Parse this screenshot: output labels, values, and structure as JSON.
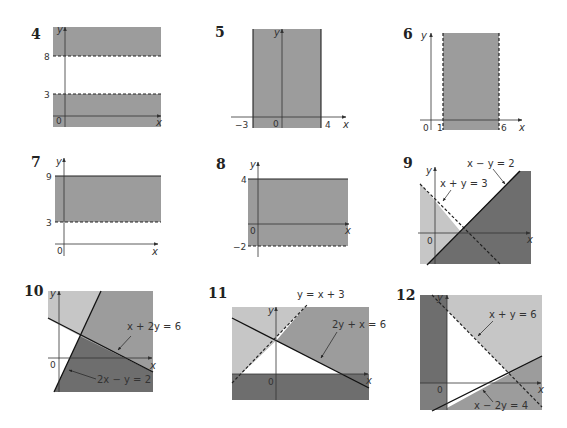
{
  "colors": {
    "background": "#ffffff",
    "shade_medium": "#9c9c9c",
    "shade_light": "#c6c6c6",
    "shade_dark": "#6e6e6e",
    "line": "#1a1a1a",
    "axis": "#333333"
  },
  "panels": [
    {
      "number": "4",
      "description": "Two horizontal bands shaded: y > 8 and y < 3 (dashed boundaries)",
      "ticks": {
        "y": [
          "8",
          "3"
        ],
        "origin": "0"
      },
      "axes": {
        "x": "x",
        "y": "y"
      },
      "boundaries": [
        {
          "label": "y = 8",
          "style": "dashed"
        },
        {
          "label": "y = 3",
          "style": "dashed"
        }
      ]
    },
    {
      "number": "5",
      "description": "Vertical band shaded between x = -3 and x = 4 (solid boundaries)",
      "ticks": {
        "x": [
          "−3",
          "4"
        ],
        "origin": "0"
      },
      "axes": {
        "x": "x",
        "y": "y"
      },
      "boundaries": [
        {
          "label": "x = -3",
          "style": "solid"
        },
        {
          "label": "x = 4",
          "style": "solid"
        }
      ]
    },
    {
      "number": "6",
      "description": "Vertical band shaded between x = 1 and x = 6 (dashed boundaries)",
      "ticks": {
        "x": [
          "1",
          "6"
        ],
        "origin": "0"
      },
      "axes": {
        "x": "x",
        "y": "y"
      },
      "boundaries": [
        {
          "label": "x = 1",
          "style": "dashed"
        },
        {
          "label": "x = 6",
          "style": "dashed"
        }
      ]
    },
    {
      "number": "7",
      "description": "Horizontal band shaded between y = 3 (dashed) and y = 9 (solid)",
      "ticks": {
        "y": [
          "9",
          "3"
        ],
        "origin": "0"
      },
      "axes": {
        "x": "x",
        "y": "y"
      },
      "boundaries": [
        {
          "label": "y = 9",
          "style": "solid"
        },
        {
          "label": "y = 3",
          "style": "dashed"
        }
      ]
    },
    {
      "number": "8",
      "description": "Horizontal band shaded between y = -2 (dashed) and y = 4 (solid)",
      "ticks": {
        "y": [
          "4",
          "−2"
        ],
        "origin": "0"
      },
      "axes": {
        "x": "x",
        "y": "y"
      },
      "boundaries": [
        {
          "label": "y = 4",
          "style": "solid"
        },
        {
          "label": "y = -2",
          "style": "dashed"
        }
      ]
    },
    {
      "number": "9",
      "description": "Regions bounded by x + y = 3 (dashed) and x - y = 2 (solid)",
      "ticks": {
        "origin": "0"
      },
      "axes": {
        "x": "x",
        "y": "y"
      },
      "labels": [
        "x − y = 2",
        "x + y = 3"
      ],
      "boundaries": [
        {
          "label": "x - y = 2",
          "style": "solid"
        },
        {
          "label": "x + y = 3",
          "style": "dashed"
        }
      ]
    },
    {
      "number": "10",
      "description": "Regions bounded by x + 2y = 6 (solid) and 2x - y = 2 (solid)",
      "ticks": {
        "origin": "0"
      },
      "axes": {
        "x": "x",
        "y": "y"
      },
      "labels": [
        "x + 2y = 6",
        "2x − y = 2"
      ],
      "boundaries": [
        {
          "label": "x + 2y = 6",
          "style": "solid"
        },
        {
          "label": "2x - y = 2",
          "style": "solid"
        }
      ]
    },
    {
      "number": "11",
      "description": "Unshaded triangle bounded by y = x + 3 (dashed), 2y + x = 6 (solid) and the x-axis",
      "ticks": {
        "origin": "0"
      },
      "axes": {
        "x": "x",
        "y": "y"
      },
      "labels": [
        "y = x + 3",
        "2y + x = 6"
      ],
      "boundaries": [
        {
          "label": "y = x + 3",
          "style": "dashed"
        },
        {
          "label": "2y + x = 6",
          "style": "solid"
        },
        {
          "label": "y = 0",
          "style": "solid"
        }
      ]
    },
    {
      "number": "12",
      "description": "Unshaded region bounded by x = 0, x + y = 6 (dashed) and x - 2y = 4 (solid)",
      "ticks": {
        "origin": "0"
      },
      "axes": {
        "x": "x",
        "y": "y"
      },
      "labels": [
        "x + y = 6",
        "x − 2y = 4"
      ],
      "boundaries": [
        {
          "label": "x + y = 6",
          "style": "dashed"
        },
        {
          "label": "x - 2y = 4",
          "style": "solid"
        },
        {
          "label": "x = 0",
          "style": "solid"
        }
      ]
    }
  ]
}
